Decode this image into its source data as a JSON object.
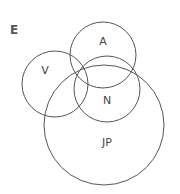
{
  "panel_label": "E",
  "diagram": {
    "type": "venn",
    "sets": [
      {
        "label": "A",
        "cx": 103,
        "cy": 55,
        "r": 33,
        "label_x": 103,
        "label_y": 42
      },
      {
        "label": "V",
        "cx": 55,
        "cy": 84,
        "r": 33,
        "label_x": 45,
        "label_y": 71
      },
      {
        "label": "N",
        "cx": 107,
        "cy": 89,
        "r": 33,
        "label_x": 107,
        "label_y": 101
      },
      {
        "label": "JP",
        "cx": 104,
        "cy": 125,
        "r": 60,
        "label_x": 107,
        "label_y": 143
      }
    ],
    "stroke_color": "#555555"
  }
}
